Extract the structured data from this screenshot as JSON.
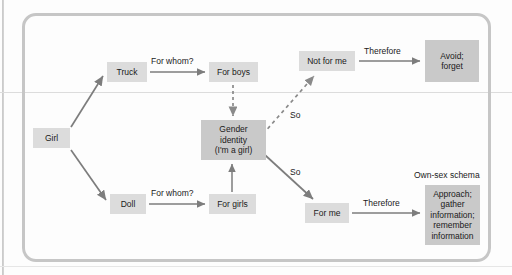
{
  "diagram": {
    "title_label": "Own-sex schema",
    "container": {
      "shape": "rounded-rectangle"
    },
    "colors": {
      "node_fill": "#dcdcdc",
      "node_fill_emphasis": "#c9c9c9",
      "arrow": "#7d7d7d",
      "border": "#c6c6c6",
      "text": "#1a1a1a"
    },
    "nodes": [
      {
        "id": "girl",
        "label": "Girl",
        "x": 33,
        "y": 128,
        "w": 37,
        "h": 20,
        "emphasis": false
      },
      {
        "id": "truck",
        "label": "Truck",
        "x": 107,
        "y": 62,
        "w": 40,
        "h": 20,
        "emphasis": false
      },
      {
        "id": "for-boys",
        "label": "For boys",
        "x": 209,
        "y": 62,
        "w": 49,
        "h": 20,
        "emphasis": false
      },
      {
        "id": "not-for-me",
        "label": "Not for me",
        "x": 299,
        "y": 51,
        "w": 56,
        "h": 20,
        "emphasis": false
      },
      {
        "id": "avoid-forget",
        "label": "Avoid;\nforget",
        "x": 425,
        "y": 40,
        "w": 54,
        "h": 42,
        "emphasis": true
      },
      {
        "id": "gender-identity",
        "label": "Gender\nidentity\n(I'm a girl)",
        "x": 201,
        "y": 120,
        "w": 65,
        "h": 40,
        "emphasis": true
      },
      {
        "id": "doll",
        "label": "Doll",
        "x": 110,
        "y": 194,
        "w": 36,
        "h": 20,
        "emphasis": false
      },
      {
        "id": "for-girls",
        "label": "For girls",
        "x": 209,
        "y": 194,
        "w": 47,
        "h": 20,
        "emphasis": false
      },
      {
        "id": "for-me",
        "label": "For me",
        "x": 305,
        "y": 203,
        "w": 44,
        "h": 20,
        "emphasis": false
      },
      {
        "id": "approach",
        "label": "Approach;\ngather\ninformation;\nremember\ninformation",
        "x": 425,
        "y": 185,
        "w": 55,
        "h": 60,
        "emphasis": true
      }
    ],
    "edges": [
      {
        "id": "girl-truck",
        "from": "girl",
        "to": "truck",
        "label": "",
        "style": "solid"
      },
      {
        "id": "truck-for-boys",
        "from": "truck",
        "to": "for-boys",
        "label": "For whom?",
        "style": "solid"
      },
      {
        "id": "for-boys-gender",
        "from": "for-boys",
        "to": "gender-identity",
        "label": "",
        "style": "dashed"
      },
      {
        "id": "gender-not-for-me",
        "from": "gender-identity",
        "to": "not-for-me",
        "label": "So",
        "style": "dashed"
      },
      {
        "id": "not-for-me-avoid",
        "from": "not-for-me",
        "to": "avoid-forget",
        "label": "Therefore",
        "style": "solid"
      },
      {
        "id": "girl-doll",
        "from": "girl",
        "to": "doll",
        "label": "",
        "style": "solid"
      },
      {
        "id": "doll-for-girls",
        "from": "doll",
        "to": "for-girls",
        "label": "For whom?",
        "style": "solid"
      },
      {
        "id": "for-girls-gender",
        "from": "for-girls",
        "to": "gender-identity",
        "label": "",
        "style": "solid"
      },
      {
        "id": "gender-for-me",
        "from": "gender-identity",
        "to": "for-me",
        "label": "So",
        "style": "solid"
      },
      {
        "id": "for-me-approach",
        "from": "for-me",
        "to": "approach",
        "label": "Therefore",
        "style": "solid"
      }
    ],
    "edge_labels": {
      "for_whom_top": "For whom?",
      "for_whom_bottom": "For whom?",
      "therefore_top": "Therefore",
      "therefore_bottom": "Therefore",
      "so_top": "So",
      "so_bottom": "So"
    },
    "node_labels": {
      "girl": "Girl",
      "truck": "Truck",
      "for_boys": "For boys",
      "not_for_me": "Not for me",
      "avoid_forget_line1": "Avoid;",
      "avoid_forget_line2": "forget",
      "gender_line1": "Gender",
      "gender_line2": "identity",
      "gender_line3": "(I'm a girl)",
      "doll": "Doll",
      "for_girls": "For girls",
      "for_me": "For me",
      "approach_line1": "Approach;",
      "approach_line2": "gather",
      "approach_line3": "information;",
      "approach_line4": "remember",
      "approach_line5": "information"
    }
  }
}
